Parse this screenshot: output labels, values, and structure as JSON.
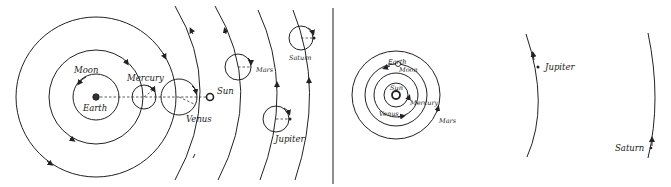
{
  "figure": {
    "panels": [
      {
        "id": "geocentric",
        "title": "",
        "labels": {
          "earth": "Earth",
          "moon": "Moon",
          "mercury": "Mercury",
          "venus": "Venus",
          "sun": "Sun",
          "mars": "Mars",
          "jupiter": "Jupiter",
          "saturn": "Saturn"
        }
      },
      {
        "id": "heliocentric",
        "title": "",
        "labels": {
          "sun": "Sun",
          "earth": "Earth",
          "moon": "Moon",
          "mercury": "Mercury",
          "venus": "Venus",
          "mars": "Mars",
          "jupiter": "Jupiter",
          "saturn": "Saturn"
        }
      }
    ],
    "colors": {
      "line": "#222222",
      "background": "#ffffff"
    }
  }
}
